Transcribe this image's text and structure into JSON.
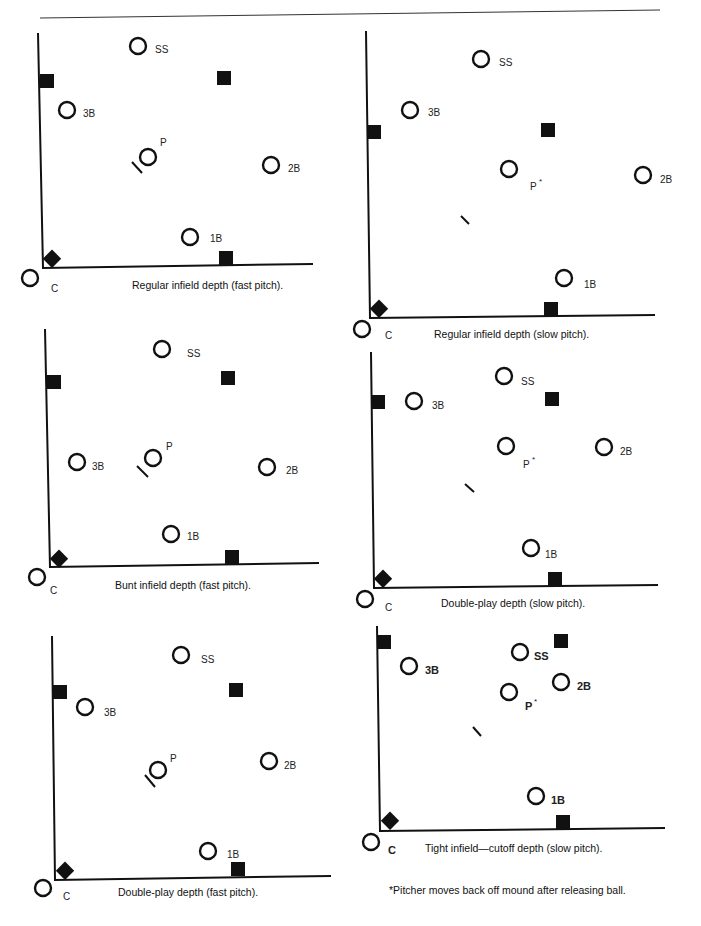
{
  "page": {
    "top_rule": {
      "x1": 40,
      "y1": 18,
      "x2": 660,
      "y2": 10
    },
    "footnote": "*Pitcher moves back off mound after releasing ball.",
    "ink_color": "#111111"
  },
  "diagrams": [
    {
      "id": "regular-fast",
      "caption": "Regular infield depth (fast pitch).",
      "caption_pos": [
        132,
        289
      ],
      "axis": {
        "top": [
          38,
          33
        ],
        "corner": [
          43,
          268
        ],
        "right": [
          313,
          264
        ]
      },
      "bases": [
        [
          47,
          81
        ],
        [
          224,
          78
        ],
        [
          226,
          258
        ]
      ],
      "home": [
        52,
        258
      ],
      "rubber": [
        [
          132,
          162
        ],
        [
          142,
          173
        ]
      ],
      "players": [
        {
          "pos": "SS",
          "c": [
            138,
            46
          ],
          "label": [
            155,
            49
          ]
        },
        {
          "pos": "3B",
          "c": [
            67,
            110
          ],
          "label": [
            83,
            113
          ]
        },
        {
          "pos": "P",
          "c": [
            148,
            157
          ],
          "label": [
            160,
            142
          ]
        },
        {
          "pos": "2B",
          "c": [
            271,
            165
          ],
          "label": [
            288,
            168
          ]
        },
        {
          "pos": "1B",
          "c": [
            190,
            237
          ],
          "label": [
            210,
            238
          ]
        },
        {
          "pos": "C",
          "c": [
            30,
            278
          ],
          "label": [
            51,
            288
          ]
        }
      ]
    },
    {
      "id": "regular-slow",
      "caption": "Regular infield depth (slow pitch).",
      "caption_pos": [
        434,
        338
      ],
      "axis": {
        "top": [
          366,
          31
        ],
        "corner": [
          370,
          318
        ],
        "right": [
          655,
          315
        ]
      },
      "bases": [
        [
          374,
          132
        ],
        [
          548,
          130
        ],
        [
          551,
          309
        ]
      ],
      "home": [
        379,
        308
      ],
      "rubber": [
        [
          461,
          216
        ],
        [
          469,
          224
        ]
      ],
      "players": [
        {
          "pos": "SS",
          "c": [
            481,
            59
          ],
          "label": [
            499,
            62
          ]
        },
        {
          "pos": "3B",
          "c": [
            410,
            110
          ],
          "label": [
            428,
            112
          ]
        },
        {
          "pos": "P",
          "c": [
            509,
            169
          ],
          "label": [
            530,
            186
          ],
          "asterisk": true
        },
        {
          "pos": "2B",
          "c": [
            643,
            175
          ],
          "label": [
            660,
            179
          ]
        },
        {
          "pos": "1B",
          "c": [
            564,
            278
          ],
          "label": [
            584,
            284
          ]
        },
        {
          "pos": "C",
          "c": [
            362,
            329
          ],
          "label": [
            385,
            335
          ]
        }
      ]
    },
    {
      "id": "bunt-fast",
      "caption": "Bunt infield depth (fast pitch).",
      "caption_pos": [
        115,
        589
      ],
      "axis": {
        "top": [
          45,
          329
        ],
        "corner": [
          50,
          567
        ],
        "right": [
          319,
          563
        ]
      },
      "bases": [
        [
          54,
          382
        ],
        [
          228,
          378
        ],
        [
          232,
          557
        ]
      ],
      "home": [
        59,
        558
      ],
      "rubber": [
        [
          137,
          466
        ],
        [
          148,
          477
        ]
      ],
      "players": [
        {
          "pos": "SS",
          "c": [
            162,
            349
          ],
          "label": [
            187,
            353
          ]
        },
        {
          "pos": "3B",
          "c": [
            77,
            462
          ],
          "label": [
            92,
            466
          ]
        },
        {
          "pos": "P",
          "c": [
            153,
            458
          ],
          "label": [
            166,
            446
          ]
        },
        {
          "pos": "2B",
          "c": [
            267,
            467
          ],
          "label": [
            286,
            470
          ]
        },
        {
          "pos": "1B",
          "c": [
            171,
            534
          ],
          "label": [
            187,
            536
          ]
        },
        {
          "pos": "C",
          "c": [
            37,
            577
          ],
          "label": [
            50,
            590
          ]
        }
      ]
    },
    {
      "id": "doubleplay-slow",
      "caption": "Double-play depth (slow pitch).",
      "caption_pos": [
        441,
        607
      ],
      "axis": {
        "top": [
          371,
          352
        ],
        "corner": [
          374,
          588
        ],
        "right": [
          658,
          585
        ]
      },
      "bases": [
        [
          378,
          402
        ],
        [
          552,
          399
        ],
        [
          555,
          579
        ]
      ],
      "home": [
        383,
        578
      ],
      "rubber": [
        [
          465,
          484
        ],
        [
          474,
          492
        ]
      ],
      "players": [
        {
          "pos": "SS",
          "c": [
            504,
            376
          ],
          "label": [
            521,
            381
          ]
        },
        {
          "pos": "3B",
          "c": [
            414,
            401
          ],
          "label": [
            432,
            405
          ]
        },
        {
          "pos": "P",
          "c": [
            506,
            446
          ],
          "label": [
            523,
            464
          ],
          "asterisk": true
        },
        {
          "pos": "2B",
          "c": [
            604,
            447
          ],
          "label": [
            620,
            451
          ]
        },
        {
          "pos": "1B",
          "c": [
            531,
            548
          ],
          "label": [
            545,
            554
          ]
        },
        {
          "pos": "C",
          "c": [
            365,
            599
          ],
          "label": [
            385,
            607
          ]
        }
      ]
    },
    {
      "id": "doubleplay-fast",
      "caption": "Double-play depth (fast pitch).",
      "caption_pos": [
        118,
        896
      ],
      "axis": {
        "top": [
          52,
          636
        ],
        "corner": [
          55,
          880
        ],
        "right": [
          331,
          876
        ]
      },
      "bases": [
        [
          60,
          692
        ],
        [
          236,
          690
        ],
        [
          238,
          869
        ]
      ],
      "home": [
        65,
        870
      ],
      "rubber": [
        [
          145,
          775
        ],
        [
          155,
          787
        ]
      ],
      "players": [
        {
          "pos": "SS",
          "c": [
            181,
            655
          ],
          "label": [
            201,
            659
          ]
        },
        {
          "pos": "3B",
          "c": [
            85,
            707
          ],
          "label": [
            104,
            712
          ]
        },
        {
          "pos": "P",
          "c": [
            158,
            770
          ],
          "label": [
            170,
            758
          ]
        },
        {
          "pos": "2B",
          "c": [
            269,
            761
          ],
          "label": [
            284,
            765
          ]
        },
        {
          "pos": "1B",
          "c": [
            208,
            851
          ],
          "label": [
            227,
            854
          ]
        },
        {
          "pos": "C",
          "c": [
            43,
            888
          ],
          "label": [
            63,
            896
          ]
        }
      ]
    },
    {
      "id": "tight-cutoff-slow",
      "caption": "Tight infield—cutoff depth (slow pitch).",
      "caption_pos": [
        425,
        852
      ],
      "axis": {
        "top": [
          377,
          626
        ],
        "corner": [
          380,
          831
        ],
        "right": [
          665,
          828
        ]
      },
      "bases": [
        [
          384,
          642
        ],
        [
          561,
          641
        ],
        [
          563,
          822
        ]
      ],
      "home": [
        390,
        820
      ],
      "rubber": [
        [
          473,
          727
        ],
        [
          481,
          736
        ]
      ],
      "players": [
        {
          "pos": "SS",
          "c": [
            520,
            652
          ],
          "label": [
            534,
            656
          ],
          "bold": true
        },
        {
          "pos": "3B",
          "c": [
            409,
            666
          ],
          "label": [
            425,
            670
          ],
          "bold": true
        },
        {
          "pos": "P",
          "c": [
            509,
            692
          ],
          "label": [
            525,
            706
          ],
          "asterisk": true,
          "bold": true
        },
        {
          "pos": "2B",
          "c": [
            561,
            682
          ],
          "label": [
            577,
            686
          ],
          "bold": true
        },
        {
          "pos": "1B",
          "c": [
            536,
            796
          ],
          "label": [
            551,
            800
          ],
          "bold": true
        },
        {
          "pos": "C",
          "c": [
            371,
            842
          ],
          "label": [
            388,
            850
          ],
          "bold": true
        }
      ]
    }
  ]
}
